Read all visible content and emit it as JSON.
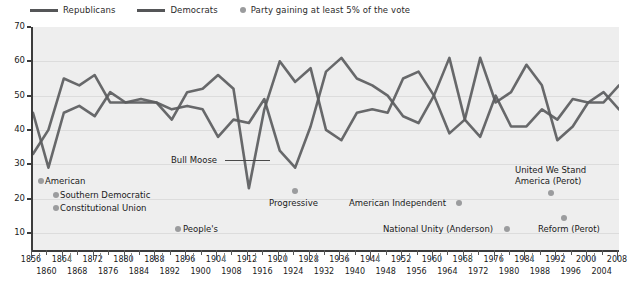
{
  "legend": {
    "republicans_label": "Republicans",
    "democrats_label": "Democrats",
    "third_party_label": "Party gaining at least 5% of the vote",
    "line_color": "#555658",
    "dot_color": "#9a9b9d"
  },
  "axes": {
    "ylabel": "Percentage of the vote",
    "yticks": [
      "70",
      "60",
      "50",
      "40",
      "30",
      "20",
      "10"
    ],
    "ylim": [
      5,
      70
    ],
    "xlim": [
      1856,
      2008
    ],
    "xticks_row1": [
      "1856",
      "1864",
      "1872",
      "1880",
      "1888",
      "1896",
      "1904",
      "1912",
      "1920",
      "1928",
      "1936",
      "1944",
      "1952",
      "1960",
      "1968",
      "1976",
      "1984",
      "1992",
      "2000",
      "2008"
    ],
    "xticks_row2": [
      "1860",
      "1868",
      "1876",
      "1884",
      "1892",
      "1900",
      "1908",
      "1916",
      "1924",
      "1932",
      "1940",
      "1948",
      "1956",
      "1964",
      "1972",
      "1980",
      "1988",
      "1996",
      "2004"
    ]
  },
  "annotations": [
    {
      "name": "american",
      "text": "American",
      "dot_side": "left"
    },
    {
      "name": "southern-democratic",
      "text": "Southern Democratic",
      "dot_side": "left"
    },
    {
      "name": "constitutional-union",
      "text": "Constitutional Union",
      "dot_side": "left"
    },
    {
      "name": "peoples",
      "text": "People's",
      "dot_side": "left"
    },
    {
      "name": "bull-moose",
      "text": "Bull Moose",
      "dot_side": "leader"
    },
    {
      "name": "progressive",
      "text": "Progressive",
      "dot_side": "above"
    },
    {
      "name": "american-independent",
      "text": "American Independent",
      "dot_side": "right"
    },
    {
      "name": "national-unity-anderson",
      "text": "National Unity (Anderson)",
      "dot_side": "right"
    },
    {
      "name": "united-we-stand-america",
      "text": "United We Stand\nAmerica (Perot)",
      "dot_side": "below"
    },
    {
      "name": "reform-perot",
      "text": "Reform (Perot)",
      "dot_side": "above"
    }
  ],
  "annotation_text": {
    "american": "American",
    "southern_democratic": "Southern Democratic",
    "constitutional_union": "Constitutional Union",
    "peoples": "People's",
    "bull_moose": "Bull Moose",
    "progressive": "Progressive",
    "american_independent": "American Independent",
    "national_unity": "National Unity (Anderson)",
    "uwsa_line1": "United We Stand",
    "uwsa_line2": "America (Perot)",
    "reform": "Reform (Perot)"
  },
  "chart_data": {
    "type": "line",
    "title": "",
    "xlabel": "",
    "ylabel": "Percentage of the vote",
    "ylim": [
      5,
      70
    ],
    "xlim": [
      1856,
      2008
    ],
    "grid": true,
    "legend_position": "top-left",
    "x": [
      1856,
      1860,
      1864,
      1868,
      1872,
      1876,
      1880,
      1884,
      1888,
      1892,
      1896,
      1900,
      1904,
      1908,
      1912,
      1916,
      1920,
      1924,
      1928,
      1932,
      1936,
      1940,
      1944,
      1948,
      1952,
      1956,
      1960,
      1964,
      1968,
      1972,
      1976,
      1980,
      1984,
      1988,
      1992,
      1996,
      2000,
      2004,
      2008
    ],
    "series": [
      {
        "name": "Republicans",
        "values": [
          33,
          40,
          55,
          53,
          56,
          48,
          48,
          48,
          48,
          43,
          51,
          52,
          56,
          52,
          23,
          46,
          60,
          54,
          58,
          40,
          37,
          45,
          46,
          45,
          55,
          57,
          50,
          39,
          43,
          61,
          48,
          51,
          59,
          53,
          37,
          41,
          48,
          51,
          46
        ]
      },
      {
        "name": "Democrats",
        "values": [
          45,
          29,
          45,
          47,
          44,
          51,
          48,
          49,
          48,
          46,
          47,
          46,
          38,
          43,
          42,
          49,
          34,
          29,
          41,
          57,
          61,
          55,
          53,
          50,
          44,
          42,
          50,
          61,
          43,
          38,
          50,
          41,
          41,
          46,
          43,
          49,
          48,
          48,
          53
        ]
      }
    ],
    "third_party_markers": [
      {
        "label": "American",
        "year": 1856,
        "value": 22
      },
      {
        "label": "Southern Democratic",
        "year": 1860,
        "value": 18
      },
      {
        "label": "Constitutional Union",
        "year": 1860,
        "value": 13
      },
      {
        "label": "People's",
        "year": 1892,
        "value": 9
      },
      {
        "label": "Bull Moose",
        "year": 1912,
        "value": 27
      },
      {
        "label": "Progressive",
        "year": 1924,
        "value": 17
      },
      {
        "label": "American Independent",
        "year": 1968,
        "value": 14
      },
      {
        "label": "National Unity (Anderson)",
        "year": 1980,
        "value": 7
      },
      {
        "label": "United We Stand America (Perot)",
        "year": 1992,
        "value": 19
      },
      {
        "label": "Reform (Perot)",
        "year": 1996,
        "value": 8
      }
    ]
  }
}
